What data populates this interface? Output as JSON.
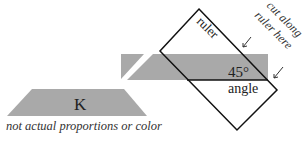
{
  "diagram": {
    "colors": {
      "fill_gray": "#a9a9a9",
      "stroke": "#111111",
      "text": "#222222",
      "background": "#ffffff"
    },
    "labels": {
      "ruler": "ruler",
      "angle_value": "45°",
      "angle": "angle",
      "cut_line1": "cut along",
      "cut_line2": "ruler here",
      "piece_k": "K",
      "caption": "not actual proportions or color"
    },
    "icons": {
      "arrow_1": "arrow-down-left-icon",
      "arrow_2": "arrow-down-left-icon"
    }
  }
}
